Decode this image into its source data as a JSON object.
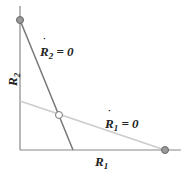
{
  "diagram": {
    "x_axis_label": "R",
    "x_axis_sub": "1",
    "y_axis_label": "R",
    "y_axis_sub": "2",
    "nullcline_r2": {
      "label": "R",
      "sub": "2",
      "eq": " = 0"
    },
    "nullcline_r1": {
      "label": "R",
      "sub": "1",
      "eq": " = 0"
    },
    "points": [
      {
        "name": "r2-axis-equilibrium",
        "filled": true
      },
      {
        "name": "coexistence-equilibrium",
        "filled": false
      },
      {
        "name": "r1-axis-equilibrium",
        "filled": true
      }
    ]
  }
}
